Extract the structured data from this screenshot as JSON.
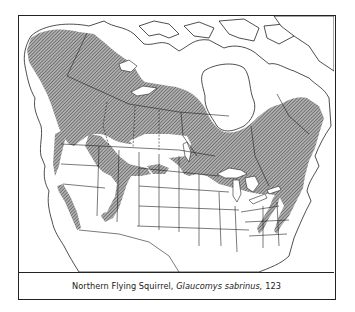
{
  "figure": {
    "caption": {
      "common_name": "Northern Flying Squirrel,",
      "scientific_name": "Glaucomys sabrinus,",
      "map_number": "123"
    },
    "map": {
      "region": "North America (Canada, Alaska, contiguous United States)",
      "layers": [
        {
          "name": "species-range",
          "label": "Range of Northern Flying Squirrel",
          "style": "diagonal hatching"
        },
        {
          "name": "land",
          "style": "white"
        },
        {
          "name": "boundaries",
          "style": "thin black lines (country, state/province)"
        }
      ]
    },
    "colors": {
      "range_hatch": "#555555",
      "range_fill": "#9a9a9a",
      "border": "#222222",
      "background": "#ffffff"
    }
  }
}
